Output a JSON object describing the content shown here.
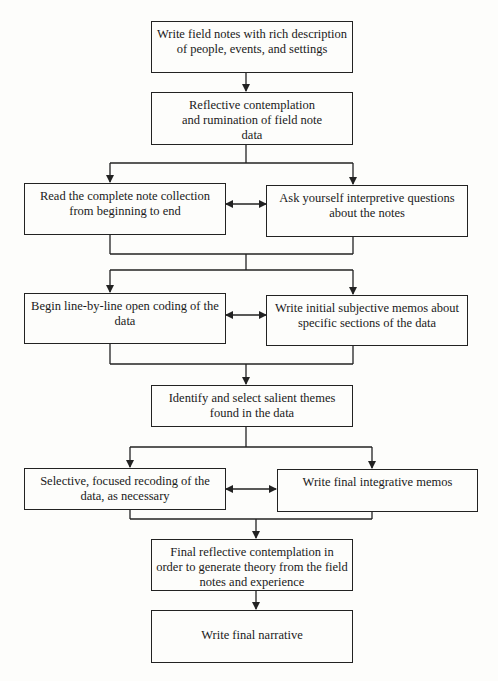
{
  "diagram": {
    "type": "flowchart",
    "nodes": {
      "field_notes": "Write field notes with rich description of people, events, and settings",
      "reflective": "Reflective contemplation and rumination of field note data",
      "read_notes": "Read the complete note collection from beginning to end",
      "ask_questions": "Ask yourself interpretive questions about the notes",
      "open_coding": "Begin line-by-line open coding of the data",
      "initial_memos": "Write initial subjective memos about specific sections of the data",
      "themes": "Identify and select salient themes found in the data",
      "recoding": "Selective, focused recoding of the data, as necessary",
      "integrative_memos": "Write final integrative memos",
      "final_reflective": "Final reflective contemplation in order to generate theory from the field notes and experience",
      "narrative": "Write final narrative"
    },
    "edges": [
      {
        "from": "field_notes",
        "to": "reflective",
        "type": "arrow"
      },
      {
        "from": "reflective",
        "to": [
          "read_notes",
          "ask_questions"
        ],
        "type": "split"
      },
      {
        "from": "read_notes",
        "to": "ask_questions",
        "type": "bidirectional"
      },
      {
        "from": [
          "read_notes",
          "ask_questions"
        ],
        "to": [
          "open_coding",
          "initial_memos"
        ],
        "type": "merge-split"
      },
      {
        "from": "open_coding",
        "to": "initial_memos",
        "type": "bidirectional"
      },
      {
        "from": [
          "open_coding",
          "initial_memos"
        ],
        "to": "themes",
        "type": "merge"
      },
      {
        "from": "themes",
        "to": [
          "recoding",
          "integrative_memos"
        ],
        "type": "split"
      },
      {
        "from": "recoding",
        "to": "integrative_memos",
        "type": "bidirectional"
      },
      {
        "from": [
          "recoding",
          "integrative_memos"
        ],
        "to": "final_reflective",
        "type": "merge"
      },
      {
        "from": "final_reflective",
        "to": "narrative",
        "type": "arrow"
      }
    ],
    "colors": {
      "line": "#222222",
      "background": "#fdfdfb"
    }
  }
}
